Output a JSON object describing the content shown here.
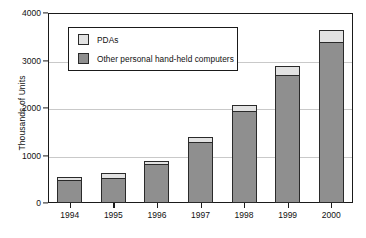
{
  "chart_data": {
    "type": "bar",
    "subtype": "stacked-vertical-bar",
    "title": "",
    "xlabel": "",
    "ylabel": "Thousands of Units",
    "categories": [
      "1994",
      "1995",
      "1996",
      "1997",
      "1998",
      "1999",
      "2000"
    ],
    "series": [
      {
        "name": "Other personal hand-held computers",
        "color": "#8f8f8f",
        "values": [
          480,
          530,
          820,
          1290,
          1940,
          2700,
          3390
        ]
      },
      {
        "name": "PDAs",
        "color": "#e2e2e2",
        "values": [
          70,
          110,
          70,
          100,
          120,
          180,
          260
        ]
      }
    ],
    "totals": [
      550,
      640,
      890,
      1390,
      2060,
      2880,
      3650
    ],
    "stack_order": [
      "Other personal hand-held computers",
      "PDAs"
    ],
    "ylim": [
      0,
      4000
    ],
    "yticks": [
      0,
      1000,
      2000,
      3000,
      4000
    ],
    "ytick_labels": [
      "0",
      "1000",
      "2000",
      "3000",
      "4000"
    ],
    "grid": "horizontal",
    "legend_position": "upper-left-inside",
    "legend_entries": [
      {
        "label": "PDAs",
        "color": "#e2e2e2"
      },
      {
        "label": "Other personal hand-held computers",
        "color": "#8f8f8f"
      }
    ]
  },
  "axes": {
    "y_title": "Thousands of Units"
  }
}
